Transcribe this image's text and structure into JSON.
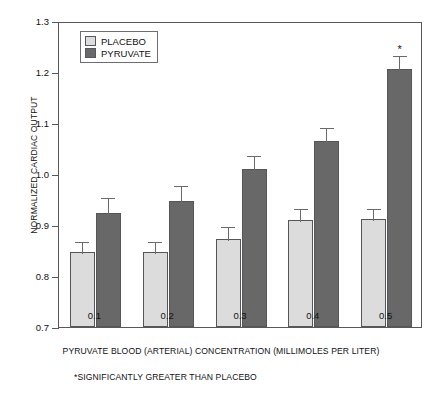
{
  "chart_data": {
    "type": "bar",
    "title": "",
    "xlabel": "PYRUVATE BLOOD (ARTERIAL) CONCENTRATION (MILLIMOLES PER LITER)",
    "ylabel": "NORMALIZED CARDIAC OUTPUT",
    "categories": [
      "0.1",
      "0.2",
      "0.3",
      "0.4",
      "0.5"
    ],
    "ylim": [
      0.7,
      1.3
    ],
    "yticks": [
      "0.7",
      "0.8",
      "0.9",
      "1.0",
      "1.1",
      "1.2",
      "1.3"
    ],
    "grid": false,
    "legend_position": "top-left",
    "series": [
      {
        "name": "PLACEBO",
        "color": "#dcdcdc",
        "values": [
          0.848,
          0.848,
          0.872,
          0.91,
          0.911
        ],
        "errors": [
          0.023,
          0.023,
          0.028,
          0.025,
          0.025
        ]
      },
      {
        "name": "PYRUVATE",
        "color": "#686868",
        "values": [
          0.924,
          0.947,
          1.01,
          1.065,
          1.205
        ],
        "errors": [
          0.033,
          0.033,
          0.03,
          0.03,
          0.03
        ]
      }
    ],
    "annotations": [
      {
        "text": "*",
        "series": "PYRUVATE",
        "category": "0.5",
        "meaning": "significantly greater than placebo"
      }
    ],
    "footnote": "*SIGNIFICANTLY GREATER THAN PLACEBO"
  }
}
